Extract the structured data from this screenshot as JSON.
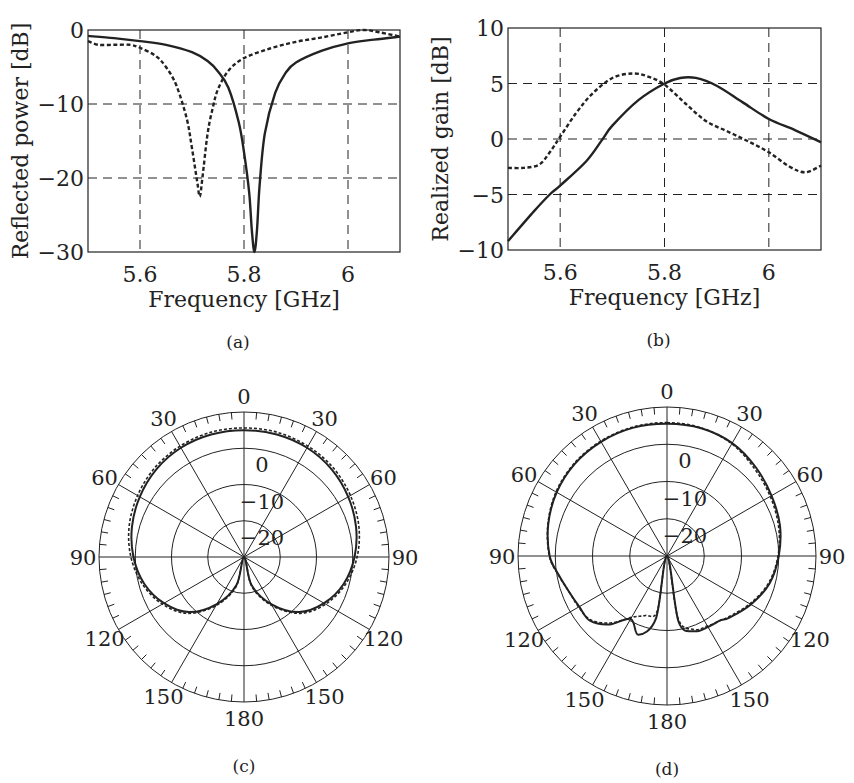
{
  "chart_data": [
    {
      "id": "a",
      "type": "line",
      "caption": "(a)",
      "xlabel": "Frequency [GHz]",
      "ylabel": "Reflected power [dB]",
      "xlim": [
        5.5,
        6.1
      ],
      "ylim": [
        -30,
        0
      ],
      "xticks": [
        5.6,
        5.8,
        6
      ],
      "xtick_labels": [
        "5.6",
        "5.8",
        "6"
      ],
      "yticks": [
        0,
        -10,
        -20,
        -30
      ],
      "ytick_labels": [
        "0",
        "−10",
        "−20",
        "−30"
      ],
      "grid": "dashed",
      "series": [
        {
          "name": "solid",
          "style": "solid",
          "x": [
            5.5,
            5.55,
            5.6,
            5.65,
            5.7,
            5.73,
            5.75,
            5.77,
            5.79,
            5.8,
            5.81,
            5.815,
            5.82,
            5.825,
            5.83,
            5.84,
            5.86,
            5.88,
            5.9,
            5.95,
            6.0,
            6.05,
            6.1
          ],
          "y": [
            -0.8,
            -1.1,
            -1.5,
            -2.0,
            -3.0,
            -4.2,
            -5.6,
            -7.8,
            -12.5,
            -16.5,
            -22,
            -27,
            -30,
            -27,
            -21,
            -14,
            -8.5,
            -5.8,
            -4.4,
            -2.8,
            -1.8,
            -1.3,
            -0.9
          ]
        },
        {
          "name": "dashed",
          "style": "dashed",
          "x": [
            5.5,
            5.52,
            5.55,
            5.58,
            5.6,
            5.63,
            5.65,
            5.67,
            5.69,
            5.7,
            5.71,
            5.715,
            5.72,
            5.73,
            5.74,
            5.75,
            5.77,
            5.8,
            5.85,
            5.9,
            5.95,
            6.0,
            6.03,
            6.06,
            6.1
          ],
          "y": [
            -1.5,
            -2.0,
            -2.0,
            -2.0,
            -2.4,
            -3.5,
            -5.0,
            -7.5,
            -12,
            -16,
            -20.5,
            -22.5,
            -20,
            -14,
            -10.5,
            -8,
            -5.5,
            -3.8,
            -2.5,
            -1.6,
            -1.0,
            -0.3,
            0,
            -0.3,
            -0.9
          ]
        }
      ]
    },
    {
      "id": "b",
      "type": "line",
      "caption": "(b)",
      "xlabel": "Frequency [GHz]",
      "ylabel": "Realized gain [dB]",
      "xlim": [
        5.5,
        6.1
      ],
      "ylim": [
        -10,
        10
      ],
      "xticks": [
        5.6,
        5.8,
        6
      ],
      "xtick_labels": [
        "5.6",
        "5.8",
        "6"
      ],
      "yticks": [
        10,
        5,
        0,
        -5,
        -10
      ],
      "ytick_labels": [
        "10",
        "5",
        "0",
        "−5",
        "−10"
      ],
      "grid": "dashed",
      "series": [
        {
          "name": "solid",
          "style": "solid",
          "x": [
            5.5,
            5.55,
            5.58,
            5.6,
            5.65,
            5.68,
            5.7,
            5.75,
            5.8,
            5.83,
            5.86,
            5.9,
            5.95,
            6.0,
            6.05,
            6.1
          ],
          "y": [
            -9.2,
            -6.5,
            -5.0,
            -4.2,
            -2.0,
            -0.1,
            1.2,
            3.5,
            5.0,
            5.5,
            5.5,
            4.8,
            3.3,
            1.8,
            0.8,
            -0.3
          ]
        },
        {
          "name": "dashed",
          "style": "dashed",
          "x": [
            5.5,
            5.53,
            5.56,
            5.58,
            5.6,
            5.63,
            5.66,
            5.7,
            5.74,
            5.77,
            5.8,
            5.84,
            5.88,
            5.92,
            5.96,
            6.0,
            6.04,
            6.07,
            6.1
          ],
          "y": [
            -2.6,
            -2.6,
            -2.3,
            -1.2,
            0.2,
            2.3,
            4.0,
            5.5,
            5.9,
            5.6,
            4.9,
            3.2,
            1.6,
            0.7,
            -0.2,
            -1.2,
            -2.5,
            -3.0,
            -2.4
          ]
        }
      ]
    },
    {
      "id": "c",
      "type": "polar",
      "caption": "(c)",
      "angle_labels": [
        "0",
        "30",
        "60",
        "90",
        "120",
        "150",
        "180",
        "150",
        "120",
        "90",
        "60",
        "30"
      ],
      "radial_labels": [
        "0",
        "−10",
        "−20"
      ],
      "rlim": [
        -30,
        10
      ],
      "rings": [
        -20,
        -10,
        0,
        10
      ],
      "spokes_deg": 30,
      "series": [
        {
          "name": "solid",
          "style": "solid",
          "theta": [
            0,
            15,
            30,
            45,
            60,
            75,
            90,
            105,
            120,
            135,
            150,
            165,
            180,
            195,
            210,
            225,
            240,
            255,
            270,
            285,
            300,
            315,
            330,
            345,
            360
          ],
          "r_db": [
            5,
            5,
            4.8,
            4.2,
            3.2,
            2,
            0.5,
            -1.5,
            -4.5,
            -8.5,
            -15,
            -22,
            -30,
            -22,
            -15,
            -8.5,
            -4.5,
            -1.5,
            0.5,
            2,
            3.2,
            4.2,
            4.8,
            5,
            5
          ]
        },
        {
          "name": "dashed",
          "style": "dashed",
          "theta": [
            0,
            15,
            30,
            45,
            60,
            75,
            90,
            105,
            120,
            135,
            150,
            165,
            180,
            195,
            210,
            225,
            240,
            255,
            270,
            285,
            300,
            315,
            330,
            345,
            360
          ],
          "r_db": [
            5.6,
            5.6,
            5.3,
            4.8,
            3.9,
            2.8,
            1.2,
            -1,
            -4,
            -8,
            -14.5,
            -21.5,
            -30,
            -21.5,
            -14.5,
            -8,
            -4,
            -1,
            1.2,
            2.8,
            3.9,
            4.8,
            5.3,
            5.6,
            5.6
          ]
        }
      ]
    },
    {
      "id": "d",
      "type": "polar",
      "caption": "(d)",
      "angle_labels": [
        "0",
        "30",
        "60",
        "90",
        "120",
        "150",
        "180",
        "150",
        "120",
        "90",
        "60",
        "30"
      ],
      "radial_labels": [
        "0",
        "−10",
        "−20"
      ],
      "rlim": [
        -30,
        10
      ],
      "rings": [
        -20,
        -10,
        0,
        10
      ],
      "spokes_deg": 30,
      "series": [
        {
          "name": "solid",
          "style": "solid",
          "theta": [
            0,
            15,
            30,
            45,
            60,
            75,
            90,
            105,
            120,
            135,
            140,
            150,
            160,
            170,
            180,
            190,
            200,
            210,
            220,
            230,
            240,
            250,
            260,
            270,
            285,
            300,
            315,
            330,
            345,
            360
          ],
          "r_db": [
            5.5,
            5.5,
            5,
            3.7,
            2.4,
            1.4,
            0,
            -1.5,
            -4,
            -6.5,
            -7.5,
            -8,
            -8.5,
            -12,
            -30,
            -13,
            -7.5,
            -10.5,
            -6,
            -3,
            -2.8,
            -2,
            -0.5,
            1.5,
            3,
            4.2,
            5,
            5.4,
            5.6,
            5.5
          ]
        },
        {
          "name": "dashed",
          "style": "dashed",
          "theta": [
            0,
            15,
            30,
            45,
            60,
            75,
            90,
            105,
            120,
            135,
            140,
            150,
            160,
            170,
            180,
            190,
            200,
            210,
            220,
            230,
            240,
            250,
            260,
            270,
            285,
            300,
            315,
            330,
            345,
            360
          ],
          "r_db": [
            5.8,
            5.6,
            4.8,
            3.2,
            2,
            1,
            -0.2,
            -1.8,
            -4.3,
            -6.8,
            -7.5,
            -8.3,
            -9,
            -13,
            -30,
            -15,
            -13,
            -11,
            -6.5,
            -3.3,
            -2.6,
            -2,
            -0.4,
            1.6,
            3.1,
            4.4,
            5.2,
            5.6,
            5.8,
            5.8
          ]
        }
      ]
    }
  ]
}
